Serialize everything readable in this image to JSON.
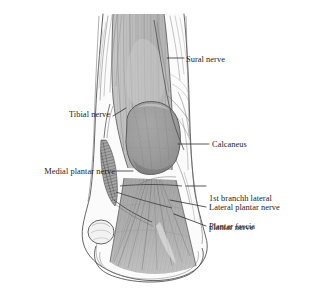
{
  "figure": {
    "background_color": "#ffffff",
    "line_color": "#3a3a3a",
    "bone_fill": "#9a9a9a",
    "tendon_fill": "#b6b6b6",
    "fascia_fill": "#a9a9a9",
    "skin_fill": "#f4f4f4",
    "label_color": "#232323"
  },
  "labels": [
    {
      "id": "sural-nerve",
      "text": "Sural nerve",
      "side": "right",
      "leader_from": [
        186,
        58
      ],
      "leader_to": [
        167,
        58
      ]
    },
    {
      "id": "tibial-nerve",
      "text": "Tibial nerve",
      "side": "left",
      "leader_from": [
        112,
        114
      ],
      "leader_to": [
        126,
        110
      ]
    },
    {
      "id": "calcaneus",
      "text": "Calcaneus",
      "side": "right",
      "leader_from": [
        210,
        144
      ],
      "leader_to": [
        178,
        144
      ]
    },
    {
      "id": "medial-plantar-nerve",
      "text": "Medial plantar nerve",
      "side": "left",
      "leader_from": [
        115,
        171
      ],
      "leader_to": [
        133,
        171
      ]
    },
    {
      "id": "first-branch-lateral-plantar-nerve",
      "text": "1st branchh lateral\nplantar nerve",
      "side": "right",
      "leader_from": [
        207,
        185
      ],
      "leader_to": [
        186,
        185
      ]
    },
    {
      "id": "lateral-plantar-nerve",
      "text": "Lateral plantar nerve",
      "side": "right",
      "leader_from": [
        207,
        207
      ],
      "leader_to": [
        168,
        200
      ]
    },
    {
      "id": "plantar-fascia",
      "text": "Plantar fascia",
      "side": "right",
      "leader_from": [
        207,
        226
      ],
      "leader_to": [
        172,
        215
      ]
    }
  ],
  "label_text": {
    "sural_nerve": "Sural nerve",
    "tibial_nerve": "Tibial nerve",
    "calcaneus": "Calcaneus",
    "medial_plantar_nerve": "Medial plantar nerve",
    "first_branch_line1": "1st branchh lateral",
    "first_branch_line2": "plantar nerve",
    "lateral_plantar_nerve": "Lateral plantar nerve",
    "plantar_fascia": "Plantar fascia"
  },
  "anatomy_parts": [
    {
      "name": "achilles-tendon",
      "description": "Vertically striated tendon running down the posterior leg"
    },
    {
      "name": "calcaneus",
      "description": "Rounded darker gray heel bone in the center"
    },
    {
      "name": "plantar-fascia",
      "description": "Fan-shaped striated band spreading from heel toward the forefoot"
    },
    {
      "name": "medial-malleolus",
      "description": "Rounded bony prominence at lower left"
    },
    {
      "name": "tibial-nerve-trunk",
      "description": "Hatched dark nerve bundle descending the medial ankle"
    },
    {
      "name": "sural-nerve-branch",
      "description": "Slender nerve crossing the posterolateral calf"
    },
    {
      "name": "heel-skin-outline",
      "description": "Outer skin contour enclosing the heel and sole"
    }
  ]
}
